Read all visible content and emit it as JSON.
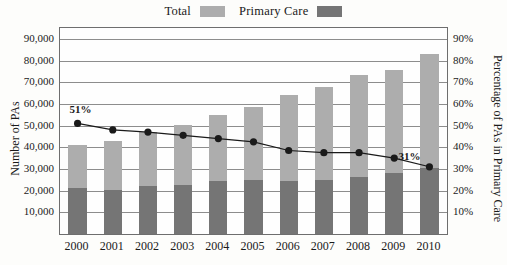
{
  "chart_data": {
    "type": "bar",
    "subtype": "stacked-bar-with-line-overlay",
    "title": "",
    "xlabel": "",
    "ylabel": "Number of PAs",
    "y2label": "Percentage of PAs in Primary Care",
    "categories": [
      "2000",
      "2001",
      "2002",
      "2003",
      "2004",
      "2005",
      "2006",
      "2007",
      "2008",
      "2009",
      "2010"
    ],
    "ylim": [
      0,
      95000
    ],
    "y2lim": [
      0,
      95
    ],
    "yticks": [
      "10,000",
      "20,000",
      "30,000",
      "40,000",
      "50,000",
      "60,000",
      "70,000",
      "80,000",
      "90,000"
    ],
    "ytick_values": [
      10000,
      20000,
      30000,
      40000,
      50000,
      60000,
      70000,
      80000,
      90000
    ],
    "y2ticks": [
      "10%",
      "20%",
      "30%",
      "40%",
      "50%",
      "60%",
      "70%",
      "80%",
      "90%"
    ],
    "y2tick_values": [
      10,
      20,
      30,
      40,
      50,
      60,
      70,
      80,
      90
    ],
    "grid": true,
    "legend_position": "top-center",
    "series": [
      {
        "name": "Total",
        "axis": "left",
        "color": "#adadad",
        "values": [
          41000,
          43000,
          47000,
          50500,
          55000,
          58500,
          64000,
          68000,
          73500,
          75500,
          83000
        ]
      },
      {
        "name": "Primary Care",
        "axis": "left",
        "color": "#757575",
        "values": [
          21000,
          20500,
          22000,
          22500,
          24500,
          25000,
          24500,
          25000,
          26500,
          28000,
          30500
        ]
      },
      {
        "name": "Percentage of PAs in Primary Care",
        "axis": "right",
        "type": "line",
        "color": "#1a1a1a",
        "values": [
          51,
          48,
          47,
          45.5,
          44,
          42.5,
          38.5,
          37.5,
          37.5,
          35,
          31
        ],
        "point_labels": [
          {
            "category": "2000",
            "text": "51%"
          },
          {
            "category": "2010",
            "text": "31%"
          }
        ]
      }
    ]
  },
  "legend": {
    "entries": [
      {
        "label": "Total",
        "color": "#adadad"
      },
      {
        "label": "Primary Care",
        "color": "#757575"
      }
    ]
  }
}
